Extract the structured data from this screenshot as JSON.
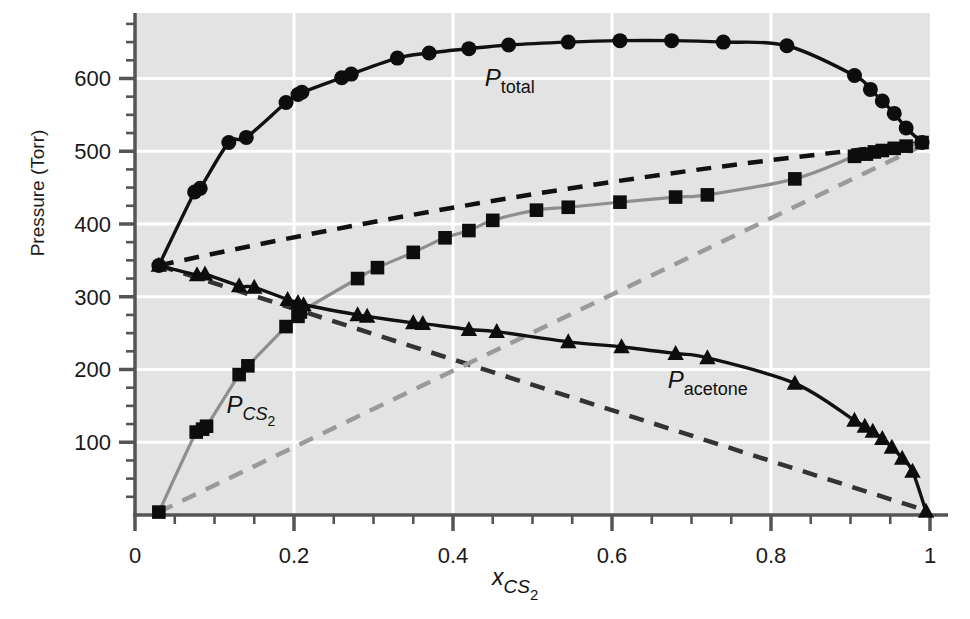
{
  "chart_data": {
    "type": "line",
    "title": "",
    "subtitle": "",
    "xlabel": "x_CS2",
    "xlabel_parts": {
      "base": "x",
      "sub": "CS",
      "subsub": "2"
    },
    "ylabel": "Pressure (Torr)",
    "xlim": [
      0,
      1
    ],
    "ylim": [
      0,
      690
    ],
    "xticks": [
      0,
      0.2,
      0.4,
      0.6,
      0.8,
      1
    ],
    "xticklabels": [
      "0",
      "0.2",
      "0.4",
      "0.6",
      "0.8",
      "1"
    ],
    "xminor_step": 0.05,
    "yticks": [
      100,
      200,
      300,
      400,
      500,
      600
    ],
    "yticklabels": [
      "100",
      "200",
      "300",
      "400",
      "500",
      "600"
    ],
    "yminor_step": 25,
    "grid": "white gridlines on light-grey panel",
    "legend_position": "inline annotations",
    "colors": {
      "panel": "#e3e3e3",
      "gridline": "#ffffff",
      "axis": "#555555",
      "total_curve": "#111111",
      "acetone_curve": "#111111",
      "cs2_curve": "#8e8e8e",
      "raoult_acetone_dashed": "#333333",
      "raoult_cs2_dashed": "#9a9a9a",
      "ideal_total_dashed": "#111111",
      "marker": "#0d0d0d"
    },
    "annotations": [
      {
        "name": "P_total",
        "base": "P",
        "sub": "total",
        "x": 0.44,
        "y": 590
      },
      {
        "name": "P_CS2",
        "base": "P",
        "sub": "CS",
        "subsub": "2",
        "x": 0.115,
        "y": 140
      },
      {
        "name": "P_acetone",
        "base": "P",
        "sub": "acetone",
        "x": 0.67,
        "y": 175
      }
    ],
    "series": [
      {
        "name": "P_total",
        "marker": "circle",
        "line": "solid-black",
        "points": [
          [
            0.03,
            343
          ],
          [
            0.075,
            444
          ],
          [
            0.082,
            449
          ],
          [
            0.118,
            512
          ],
          [
            0.14,
            519
          ],
          [
            0.19,
            567
          ],
          [
            0.205,
            578
          ],
          [
            0.21,
            581
          ],
          [
            0.26,
            601
          ],
          [
            0.272,
            606
          ],
          [
            0.33,
            628
          ],
          [
            0.37,
            635
          ],
          [
            0.42,
            641
          ],
          [
            0.47,
            646
          ],
          [
            0.545,
            650
          ],
          [
            0.61,
            652
          ],
          [
            0.675,
            652
          ],
          [
            0.74,
            650
          ],
          [
            0.82,
            645
          ],
          [
            0.905,
            604
          ],
          [
            0.925,
            585
          ],
          [
            0.94,
            569
          ],
          [
            0.955,
            552
          ],
          [
            0.97,
            532
          ],
          [
            0.99,
            512
          ]
        ]
      },
      {
        "name": "P_CS2",
        "marker": "square",
        "line": "solid-grey",
        "points": [
          [
            0.03,
            4
          ],
          [
            0.077,
            114
          ],
          [
            0.085,
            118
          ],
          [
            0.09,
            122
          ],
          [
            0.131,
            193
          ],
          [
            0.142,
            205
          ],
          [
            0.19,
            259
          ],
          [
            0.205,
            273
          ],
          [
            0.208,
            279
          ],
          [
            0.28,
            325
          ],
          [
            0.305,
            340
          ],
          [
            0.35,
            361
          ],
          [
            0.39,
            381
          ],
          [
            0.42,
            391
          ],
          [
            0.45,
            405
          ],
          [
            0.505,
            419
          ],
          [
            0.545,
            423
          ],
          [
            0.61,
            430
          ],
          [
            0.68,
            437
          ],
          [
            0.72,
            440
          ],
          [
            0.83,
            462
          ],
          [
            0.905,
            493
          ],
          [
            0.92,
            496
          ],
          [
            0.93,
            499
          ],
          [
            0.94,
            501
          ],
          [
            0.955,
            504
          ],
          [
            0.97,
            507
          ],
          [
            0.99,
            512
          ]
        ]
      },
      {
        "name": "P_acetone",
        "marker": "triangle",
        "line": "solid-black",
        "points": [
          [
            0.03,
            343
          ],
          [
            0.078,
            330
          ],
          [
            0.088,
            331
          ],
          [
            0.131,
            315
          ],
          [
            0.15,
            313
          ],
          [
            0.192,
            296
          ],
          [
            0.205,
            292
          ],
          [
            0.212,
            289
          ],
          [
            0.28,
            275
          ],
          [
            0.292,
            273
          ],
          [
            0.35,
            264
          ],
          [
            0.362,
            263
          ],
          [
            0.42,
            255
          ],
          [
            0.455,
            252
          ],
          [
            0.545,
            238
          ],
          [
            0.612,
            231
          ],
          [
            0.68,
            222
          ],
          [
            0.72,
            216
          ],
          [
            0.83,
            181
          ],
          [
            0.905,
            130
          ],
          [
            0.918,
            122
          ],
          [
            0.928,
            115
          ],
          [
            0.94,
            105
          ],
          [
            0.952,
            93
          ],
          [
            0.965,
            78
          ],
          [
            0.978,
            60
          ],
          [
            0.995,
            5
          ]
        ]
      }
    ],
    "reference_lines": [
      {
        "name": "raoult-acetone-ideal",
        "style": "dashed",
        "color": "#333333",
        "from": [
          0.03,
          343
        ],
        "to": [
          0.998,
          5
        ]
      },
      {
        "name": "raoult-cs2-ideal",
        "style": "dashed",
        "color": "#9a9a9a",
        "from": [
          0.03,
          4
        ],
        "to": [
          0.998,
          512
        ]
      },
      {
        "name": "ideal-total-dashed",
        "style": "dashed",
        "color": "#111111",
        "from": [
          0.03,
          343
        ],
        "to": [
          0.998,
          512
        ],
        "curved": true
      }
    ]
  },
  "axes": {
    "y_title": "Pressure (Torr)"
  }
}
